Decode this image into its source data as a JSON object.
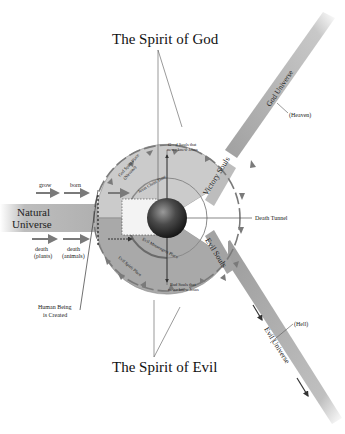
{
  "diagram": {
    "title_top": "The Spirit of God",
    "title_bottom": "The Spirit of Evil",
    "natural_universe": {
      "label_line1": "Natural",
      "label_line2": "Universe",
      "top_arrows": [
        "grow",
        "born"
      ],
      "bottom_arrows": [
        {
          "line1": "death",
          "line2": "(plants)"
        },
        {
          "line1": "death",
          "line2": "(animals)"
        }
      ]
    },
    "human_being_created": {
      "line1": "Human Being",
      "line2": "is Created"
    },
    "upper_half": {
      "outer_ring_line1": "God Spirit Place",
      "outer_ring_line2": "(Nirvana)",
      "inner_ring": "Jesus Christ Time",
      "good_souls_line1": "Good Souls that",
      "good_souls_line2": "never knew Jesus"
    },
    "lower_half": {
      "outer_ring": "Evil Spirit Place",
      "inner_ring": "Evil Messengers Place",
      "bad_souls_line1": "Bad Souls that",
      "bad_souls_line2": "never knew Jesus"
    },
    "victory_souls": "Victory Souls",
    "evil_souls": "Evil Souls",
    "death_tunnel": "Death Tunnel",
    "god_universe": "God Universe",
    "heaven": "(Heaven)",
    "evil_universe": "Evil Universe",
    "hell": "(Hell)",
    "colors": {
      "band_gray": "#b5b5b5",
      "disc_upper": "#c8c8c8",
      "disc_lower": "#a8a8a8",
      "arrow_gray": "#7a7a7a",
      "sphere_dark": "#2a2a2a"
    }
  }
}
